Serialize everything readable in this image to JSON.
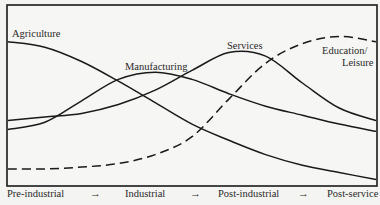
{
  "chart_data": {
    "type": "line",
    "title": "",
    "xlabel": "",
    "ylabel": "",
    "grid": false,
    "legend": "inline labels",
    "x_stages": [
      "Pre-industrial",
      "Industrial",
      "Post-industrial",
      "Post-service"
    ],
    "x_arrow": "→",
    "x": [
      0,
      0.1,
      0.2,
      0.3,
      0.4,
      0.5,
      0.6,
      0.7,
      0.8,
      0.9,
      1.0
    ],
    "ylim": [
      0,
      1
    ],
    "series": [
      {
        "name": "Agriculture",
        "style": "solid",
        "values": [
          0.8,
          0.77,
          0.69,
          0.58,
          0.46,
          0.34,
          0.25,
          0.17,
          0.11,
          0.07,
          0.03
        ]
      },
      {
        "name": "Manufacturing",
        "style": "solid",
        "values": [
          0.31,
          0.35,
          0.47,
          0.59,
          0.63,
          0.59,
          0.51,
          0.44,
          0.39,
          0.34,
          0.3
        ]
      },
      {
        "name": "Services",
        "style": "solid",
        "values": [
          0.36,
          0.38,
          0.4,
          0.45,
          0.53,
          0.64,
          0.74,
          0.72,
          0.57,
          0.43,
          0.36
        ]
      },
      {
        "name": "Education/ Leisure",
        "style": "dashed",
        "values": [
          0.09,
          0.09,
          0.1,
          0.12,
          0.17,
          0.27,
          0.48,
          0.68,
          0.79,
          0.83,
          0.8
        ]
      }
    ]
  },
  "labels": {
    "agriculture": "Agriculture",
    "manufacturing": "Manufacturing",
    "services": "Services",
    "education_line1": "Education/",
    "education_line2": "Leisure"
  },
  "axis": {
    "stage1": "Pre-industrial",
    "stage2": "Industrial",
    "stage3": "Post-industrial",
    "stage4": "Post-service",
    "arrow": "→"
  }
}
